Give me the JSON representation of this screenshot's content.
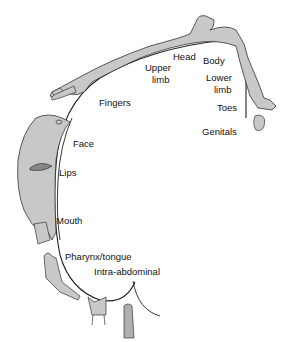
{
  "diagram": {
    "colors": {
      "body_fill": "#c8c8c8",
      "outline": "#222222",
      "background": "#ffffff"
    },
    "labels": {
      "head": "Head",
      "body": "Body",
      "upper_limb_1": "Upper",
      "upper_limb_2": "limb",
      "lower_limb_1": "Lower",
      "lower_limb_2": "limb",
      "fingers": "Fingers",
      "toes": "Toes",
      "genitals": "Genitals",
      "face": "Face",
      "lips": "Lips",
      "mouth": "Mouth",
      "pharynx_tongue": "Pharynx/tongue",
      "intra_abdominal": "Intra-abdominal"
    }
  }
}
